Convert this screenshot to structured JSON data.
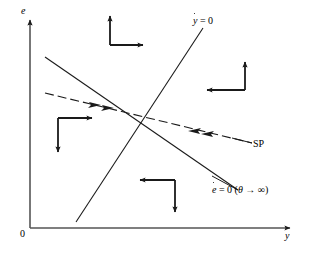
{
  "figure": {
    "type": "phase-diagram",
    "background_color": "#ffffff",
    "line_color": "#1a1a1a",
    "axes": {
      "y_axis_label": "e",
      "x_axis_label": "y",
      "origin_label": "0"
    },
    "curves": [
      {
        "id": "ydot-nullcline",
        "label_plain": "ẏ = 0",
        "label_var": "y",
        "label_rest": " = 0",
        "style": "solid",
        "slope": "positive",
        "from": [
          76,
          222
        ],
        "to": [
          203,
          28
        ]
      },
      {
        "id": "edot-nullcline",
        "label_plain": "ė = 0 (θ → ∞)",
        "label_var": "e",
        "label_rest": " = 0 (",
        "label_theta": "θ",
        "label_arrow": " → ",
        "label_infinity": "∞",
        "label_close": ")",
        "style": "solid",
        "slope": "negative",
        "from": [
          45,
          57
        ],
        "to": [
          238,
          190
        ]
      },
      {
        "id": "saddle-path",
        "label_plain": "SP",
        "style": "dashed",
        "slope": "negative",
        "from": [
          45,
          93
        ],
        "to": [
          252,
          143
        ]
      }
    ],
    "arrow_pairs": [
      {
        "id": "quadrant-top",
        "directions": [
          "up",
          "right"
        ],
        "corner": [
          110,
          45
        ]
      },
      {
        "id": "quadrant-right",
        "directions": [
          "left",
          "up"
        ],
        "corner": [
          245,
          90
        ]
      },
      {
        "id": "quadrant-left",
        "directions": [
          "right",
          "down"
        ],
        "corner": [
          58,
          118
        ]
      },
      {
        "id": "quadrant-bottom",
        "directions": [
          "left",
          "down"
        ],
        "corner": [
          175,
          180
        ]
      }
    ],
    "path_arrows": [
      {
        "id": "sp-inbound-left-1",
        "direction": "right-down"
      },
      {
        "id": "sp-inbound-left-2",
        "direction": "right-down"
      },
      {
        "id": "sp-inbound-right-1",
        "direction": "left-up"
      },
      {
        "id": "sp-inbound-right-2",
        "direction": "left-up"
      }
    ]
  }
}
